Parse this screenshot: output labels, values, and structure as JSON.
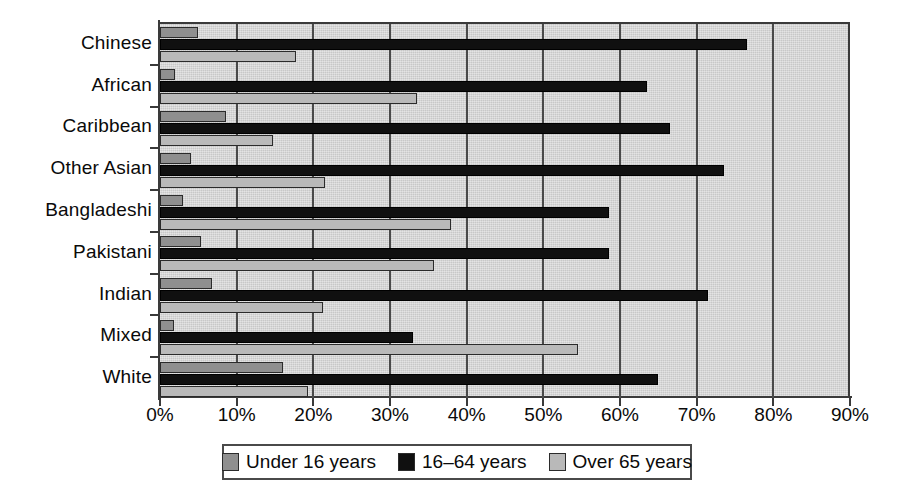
{
  "chart_data": {
    "type": "bar",
    "orientation": "horizontal",
    "title": "",
    "subtitle": "",
    "xlabel": "",
    "ylabel": "",
    "xlim": [
      0,
      90
    ],
    "xtick_labels": [
      "0%",
      "10%",
      "20%",
      "30%",
      "40%",
      "50%",
      "60%",
      "70%",
      "80%",
      "90%"
    ],
    "xticks": [
      0,
      10,
      20,
      30,
      40,
      50,
      60,
      70,
      80,
      90
    ],
    "grid": "vertical",
    "legend_position": "bottom",
    "categories": [
      "White",
      "Mixed",
      "Indian",
      "Pakistani",
      "Bangladeshi",
      "Other Asian",
      "Caribbean",
      "African",
      "Chinese"
    ],
    "categories_top_to_bottom": [
      "Chinese",
      "African",
      "Caribbean",
      "Other Asian",
      "Bangladeshi",
      "Pakistani",
      "Indian",
      "Mixed",
      "White"
    ],
    "series": [
      {
        "name": "Under 16 years",
        "color": "#8f8f8f",
        "values_top_to_bottom": [
          5.0,
          2.0,
          8.6,
          4.0,
          3.0,
          5.3,
          6.8,
          1.8,
          16.0
        ]
      },
      {
        "name": "16–64 years",
        "color": "#101010",
        "values_top_to_bottom": [
          76.5,
          63.5,
          66.5,
          73.5,
          58.5,
          58.5,
          71.5,
          33.0,
          65.0
        ]
      },
      {
        "name": "Over 65 years",
        "color": "#b9b9b9",
        "values_top_to_bottom": [
          17.8,
          33.5,
          14.8,
          21.5,
          38.0,
          35.8,
          21.3,
          54.5,
          19.3
        ]
      }
    ]
  },
  "legend": {
    "items": [
      {
        "label": "Under 16 years",
        "swatch": "s0"
      },
      {
        "label": "16–64 years",
        "swatch": "s1"
      },
      {
        "label": "Over 65 years",
        "swatch": "s2"
      }
    ]
  },
  "colors": {
    "plot_background": "#d2d2d2",
    "gridline": "#4a4a4a",
    "axis": "#3a3a3a",
    "series_under16": "#8f8f8f",
    "series_16to64": "#101010",
    "series_over65": "#b9b9b9",
    "text": "#0a0a0a"
  }
}
